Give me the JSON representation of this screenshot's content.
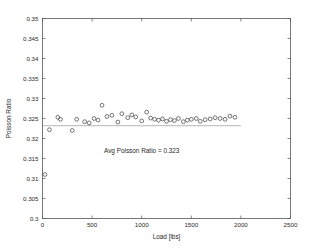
{
  "chart_data": {
    "type": "scatter",
    "title": "",
    "xlabel": "Load [lbs]",
    "ylabel": "Poisson Ratio",
    "xlim": [
      0,
      2500
    ],
    "ylim": [
      0.3,
      0.35
    ],
    "xticks": [
      0,
      500,
      1000,
      1500,
      2000,
      2500
    ],
    "xtick_labels": [
      "0",
      "500",
      "1000",
      "1500",
      "2000",
      "2500"
    ],
    "yticks": [
      0.3,
      0.305,
      0.31,
      0.315,
      0.32,
      0.325,
      0.33,
      0.335,
      0.34,
      0.345,
      0.35
    ],
    "ytick_labels": [
      "0.3",
      "0.305",
      "0.31",
      "0.315",
      "0.32",
      "0.325",
      "0.33",
      "0.335",
      "0.34",
      "0.345",
      "0.35"
    ],
    "grid": false,
    "legend": null,
    "marker": "open-circle",
    "series": [
      {
        "name": "Poisson Ratio",
        "x": [
          25,
          70,
          155,
          180,
          300,
          345,
          425,
          470,
          520,
          560,
          600,
          650,
          700,
          760,
          800,
          860,
          900,
          940,
          1000,
          1050,
          1090,
          1130,
          1170,
          1210,
          1250,
          1290,
          1330,
          1370,
          1420,
          1460,
          1500,
          1550,
          1590,
          1640,
          1690,
          1740,
          1790,
          1840,
          1890,
          1940
        ],
        "y": [
          0.311,
          0.3222,
          0.3253,
          0.3248,
          0.322,
          0.3248,
          0.3242,
          0.3239,
          0.325,
          0.3246,
          0.3283,
          0.3255,
          0.3258,
          0.3241,
          0.3262,
          0.3252,
          0.3259,
          0.3254,
          0.3244,
          0.3266,
          0.3251,
          0.3248,
          0.3246,
          0.3249,
          0.3243,
          0.3247,
          0.3245,
          0.325,
          0.3242,
          0.3246,
          0.3248,
          0.325,
          0.3243,
          0.3247,
          0.3249,
          0.3252,
          0.325,
          0.3248,
          0.3256,
          0.3253
        ]
      }
    ],
    "reference_line": {
      "type": "horizontal",
      "value": 0.3232,
      "x_start": 0,
      "x_end": 2000
    },
    "annotations": [
      {
        "text": "Avg Poisson Ratio = 0.323",
        "x": 1000,
        "y": 0.3165
      }
    ]
  },
  "colors": {
    "marker_stroke": "#4a4a4a",
    "axis": "#555555",
    "text": "#2a2a2a",
    "avg_line": "#9a9a9a",
    "background": "#ffffff"
  }
}
